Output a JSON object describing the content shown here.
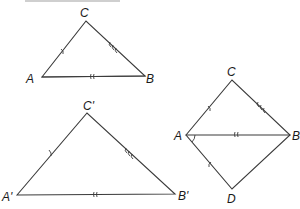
{
  "figure": {
    "triangle_1": {
      "vertices": {
        "A": {
          "label": "A",
          "x": 42,
          "y": 77
        },
        "B": {
          "label": "B",
          "x": 145,
          "y": 76
        },
        "C": {
          "label": "C",
          "x": 86,
          "y": 21
        }
      },
      "marks": {
        "AC": "single tick",
        "CB": "triple tick",
        "AB": "double tick"
      }
    },
    "triangle_2": {
      "vertices": {
        "A": {
          "label": "A'",
          "x": 17,
          "y": 195
        },
        "B": {
          "label": "B'",
          "x": 175,
          "y": 194
        },
        "C": {
          "label": "C'",
          "x": 87,
          "y": 113
        }
      },
      "marks": {
        "A'C'": "single tick",
        "C'B'": "triple tick",
        "A'B'": "double tick"
      }
    },
    "kite": {
      "vertices": {
        "C": {
          "label": "C",
          "x": 232,
          "y": 80
        },
        "A": {
          "label": "A",
          "x": 186,
          "y": 135
        },
        "B": {
          "label": "B",
          "x": 290,
          "y": 135
        },
        "D": {
          "label": "D",
          "x": 232,
          "y": 189
        }
      },
      "marks": {
        "AC": "single tick",
        "CB": "triple tick",
        "AB": "double tick",
        "AD": "single tick"
      },
      "angle_mark": "angle BAD"
    }
  }
}
